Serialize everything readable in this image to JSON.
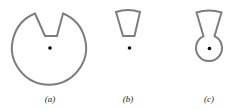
{
  "figure": {
    "stroke_color": "#7d7d7d",
    "pivot_color": "#000000",
    "panels": [
      {
        "id": "a",
        "label": "(a)",
        "shape": "circle with wedge notch cut from top",
        "has_pivot_point": true
      },
      {
        "id": "b",
        "label": "(b)",
        "shape": "annular sector (wedge) above pivot",
        "has_pivot_point": true
      },
      {
        "id": "c",
        "label": "(c)",
        "shape": "wedge joined to small circle around pivot",
        "has_pivot_point": true
      }
    ]
  }
}
